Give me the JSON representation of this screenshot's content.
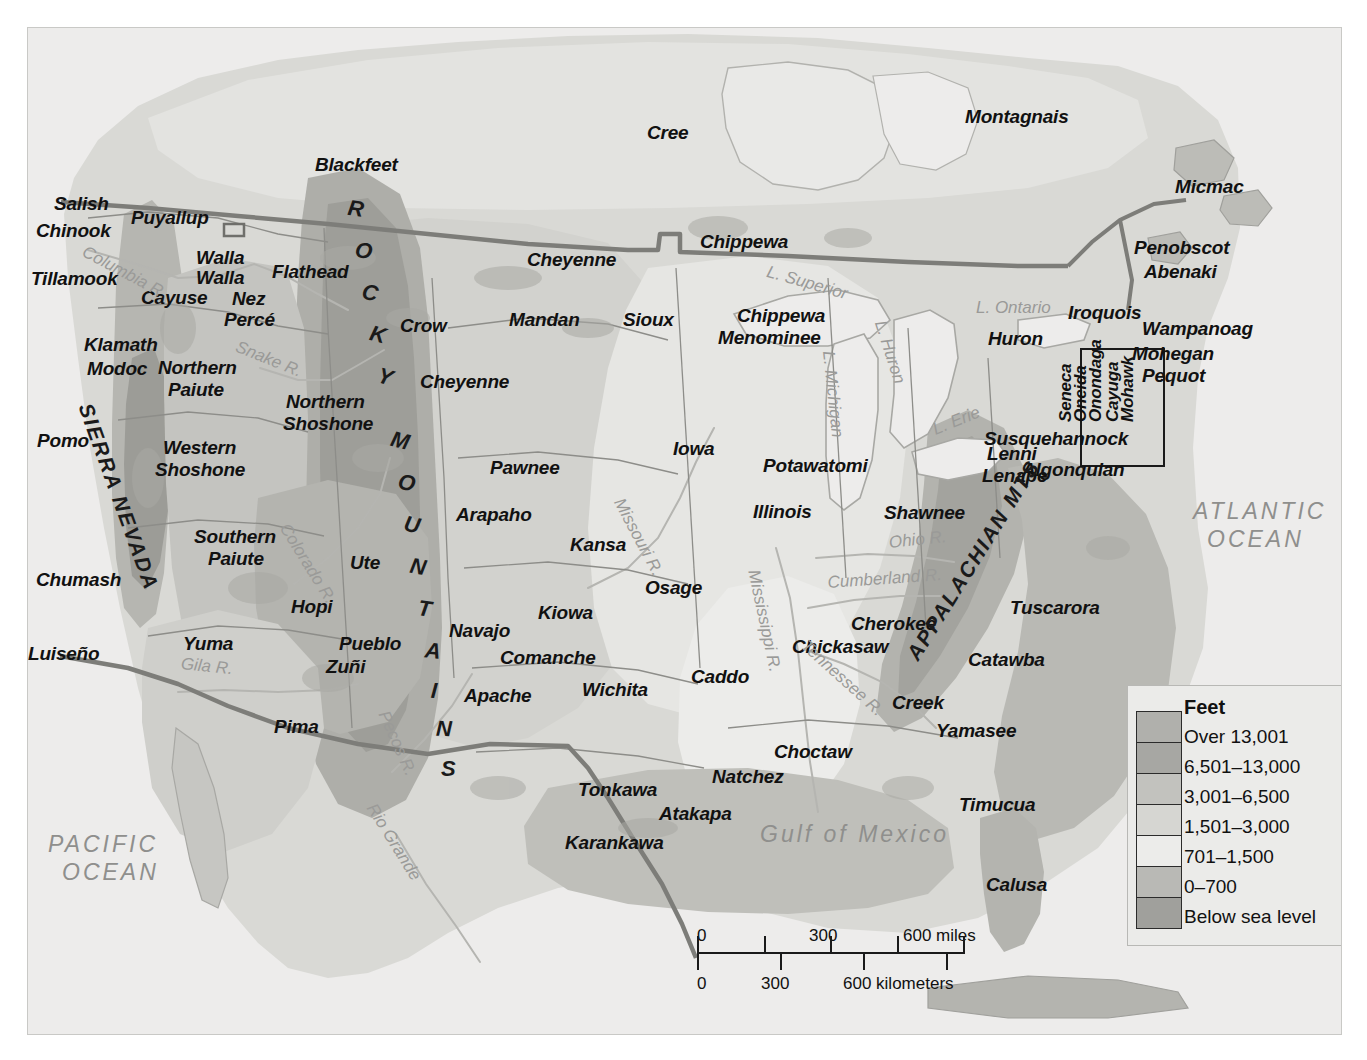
{
  "map": {
    "title": "Native American Culture Areas and Elevation of North America",
    "oceans": [
      {
        "name": "pacific-ocean",
        "lines": [
          "PACIFIC",
          "OCEAN"
        ],
        "x": 48,
        "y": 830
      },
      {
        "name": "atlantic-ocean",
        "lines": [
          "ATLANTIC",
          "OCEAN"
        ],
        "x": 1193,
        "y": 497
      },
      {
        "name": "gulf-of-mexico",
        "lines": [
          "Gulf of Mexico"
        ],
        "x": 760,
        "y": 820
      }
    ],
    "ranges": [
      {
        "name": "sierra-nevada",
        "label": "SIERRA NEVADA",
        "x": 96,
        "y": 400,
        "rotate": 70
      },
      {
        "name": "appalachian-mts",
        "label": "APPALACHIAN MTS",
        "x": 902,
        "y": 652,
        "rotate": -58
      },
      {
        "name": "rocky-mountains",
        "label": "ROCKY MOUNTAINS"
      }
    ],
    "rocky_letters": [
      {
        "ch": "R",
        "x": 348,
        "y": 196,
        "rot": 8
      },
      {
        "ch": "O",
        "x": 355,
        "y": 238,
        "rot": 10
      },
      {
        "ch": "C",
        "x": 362,
        "y": 280,
        "rot": 12
      },
      {
        "ch": "K",
        "x": 370,
        "y": 322,
        "rot": 14
      },
      {
        "ch": "Y",
        "x": 378,
        "y": 364,
        "rot": 16
      },
      {
        "ch": "M",
        "x": 391,
        "y": 428,
        "rot": 14
      },
      {
        "ch": "O",
        "x": 398,
        "y": 470,
        "rot": 13
      },
      {
        "ch": "U",
        "x": 404,
        "y": 512,
        "rot": 12
      },
      {
        "ch": "N",
        "x": 410,
        "y": 554,
        "rot": 10
      },
      {
        "ch": "T",
        "x": 418,
        "y": 596,
        "rot": 8
      },
      {
        "ch": "A",
        "x": 425,
        "y": 638,
        "rot": 6
      },
      {
        "ch": "I",
        "x": 431,
        "y": 678,
        "rot": 4
      },
      {
        "ch": "N",
        "x": 436,
        "y": 716,
        "rot": 2
      },
      {
        "ch": "S",
        "x": 441,
        "y": 756,
        "rot": 0
      }
    ],
    "hydro": [
      {
        "name": "columbia-river",
        "label": "Columbia R.",
        "x": 88,
        "y": 242,
        "rotate": 28
      },
      {
        "name": "snake-river",
        "label": "Snake R.",
        "x": 240,
        "y": 337,
        "rotate": 22
      },
      {
        "name": "colorado-river",
        "label": "Colorado R.",
        "x": 292,
        "y": 520,
        "rotate": 58
      },
      {
        "name": "gila-river",
        "label": "Gila R.",
        "x": 182,
        "y": 654,
        "rotate": 6
      },
      {
        "name": "pecos-river",
        "label": "Pecos R.",
        "x": 392,
        "y": 708,
        "rotate": 66
      },
      {
        "name": "rio-grande",
        "label": "Rio Grande",
        "x": 379,
        "y": 800,
        "rotate": 58
      },
      {
        "name": "missouri-river",
        "label": "Missouri R.",
        "x": 627,
        "y": 495,
        "rotate": 62
      },
      {
        "name": "mississippi-river",
        "label": "Mississippi R.",
        "x": 763,
        "y": 568,
        "rotate": 78
      },
      {
        "name": "ohio-river",
        "label": "Ohio R.",
        "x": 888,
        "y": 533,
        "rotate": -6
      },
      {
        "name": "cumberland-river",
        "label": "Cumberland R.",
        "x": 827,
        "y": 573,
        "rotate": -4
      },
      {
        "name": "tennessee-river",
        "label": "Tennessee R.",
        "x": 810,
        "y": 636,
        "rotate": 42
      },
      {
        "name": "lake-superior",
        "label": "L. Superior",
        "x": 770,
        "y": 262,
        "rotate": 16
      },
      {
        "name": "lake-michigan",
        "label": "L. Michigan",
        "x": 838,
        "y": 350,
        "rotate": 84
      },
      {
        "name": "lake-huron",
        "label": "L. Huron",
        "x": 889,
        "y": 318,
        "rotate": 72
      },
      {
        "name": "lake-erie",
        "label": "L. Erie",
        "x": 930,
        "y": 421,
        "rotate": -22
      },
      {
        "name": "lake-ontario",
        "label": "L. Ontario",
        "x": 976,
        "y": 298,
        "rotate": 0
      }
    ],
    "tribes": [
      {
        "label": "Salish",
        "x": 54,
        "y": 194
      },
      {
        "label": "Chinook",
        "x": 36,
        "y": 221
      },
      {
        "label": "Puyallup",
        "x": 131,
        "y": 208
      },
      {
        "label": "Tillamook",
        "x": 31,
        "y": 269
      },
      {
        "label": "Walla",
        "x": 196,
        "y": 248
      },
      {
        "label": "Walla",
        "x": 196,
        "y": 268
      },
      {
        "label": "Cayuse",
        "x": 141,
        "y": 288
      },
      {
        "label": "Nez",
        "x": 232,
        "y": 289
      },
      {
        "label": "Percé",
        "x": 224,
        "y": 310
      },
      {
        "label": "Flathead",
        "x": 272,
        "y": 262
      },
      {
        "label": "Blackfeet",
        "x": 315,
        "y": 155
      },
      {
        "label": "Cree",
        "x": 647,
        "y": 123
      },
      {
        "label": "Montagnais",
        "x": 965,
        "y": 107
      },
      {
        "label": "Micmac",
        "x": 1175,
        "y": 177
      },
      {
        "label": "Penobscot",
        "x": 1134,
        "y": 238
      },
      {
        "label": "Abenaki",
        "x": 1144,
        "y": 262
      },
      {
        "label": "Cheyenne",
        "x": 527,
        "y": 250
      },
      {
        "label": "Chippewa",
        "x": 700,
        "y": 232
      },
      {
        "label": "Chippewa",
        "x": 737,
        "y": 306
      },
      {
        "label": "Menominee",
        "x": 718,
        "y": 328
      },
      {
        "label": "Huron",
        "x": 988,
        "y": 329
      },
      {
        "label": "Iroquois",
        "x": 1068,
        "y": 303
      },
      {
        "label": "Wampanoag",
        "x": 1142,
        "y": 319
      },
      {
        "label": "Mohegan",
        "x": 1132,
        "y": 344
      },
      {
        "label": "Pequot",
        "x": 1142,
        "y": 366
      },
      {
        "label": "Klamath",
        "x": 84,
        "y": 335
      },
      {
        "label": "Modoc",
        "x": 87,
        "y": 359
      },
      {
        "label": "Northern",
        "x": 158,
        "y": 358
      },
      {
        "label": "Paiute",
        "x": 168,
        "y": 380
      },
      {
        "label": "Crow",
        "x": 400,
        "y": 316
      },
      {
        "label": "Mandan",
        "x": 509,
        "y": 310
      },
      {
        "label": "Sioux",
        "x": 623,
        "y": 310
      },
      {
        "label": "Cheyenne",
        "x": 420,
        "y": 372
      },
      {
        "label": "Northern",
        "x": 286,
        "y": 392
      },
      {
        "label": "Shoshone",
        "x": 283,
        "y": 414
      },
      {
        "label": "Pomo",
        "x": 37,
        "y": 431
      },
      {
        "label": "Western",
        "x": 163,
        "y": 438
      },
      {
        "label": "Shoshone",
        "x": 155,
        "y": 460
      },
      {
        "label": "Iowa",
        "x": 673,
        "y": 439
      },
      {
        "label": "Potawatomi",
        "x": 763,
        "y": 456
      },
      {
        "label": "Lenni",
        "x": 987,
        "y": 444
      },
      {
        "label": "Lenape",
        "x": 982,
        "y": 466
      },
      {
        "label": "Susquehannock",
        "x": 984,
        "y": 429
      },
      {
        "label": "Algonquian",
        "x": 1022,
        "y": 460
      },
      {
        "label": "Pawnee",
        "x": 490,
        "y": 458
      },
      {
        "label": "Illinois",
        "x": 753,
        "y": 502
      },
      {
        "label": "Shawnee",
        "x": 884,
        "y": 503
      },
      {
        "label": "Arapaho",
        "x": 456,
        "y": 505
      },
      {
        "label": "Southern",
        "x": 194,
        "y": 527
      },
      {
        "label": "Paiute",
        "x": 208,
        "y": 549
      },
      {
        "label": "Kansa",
        "x": 570,
        "y": 535
      },
      {
        "label": "Ute",
        "x": 350,
        "y": 553
      },
      {
        "label": "Chumash",
        "x": 36,
        "y": 570
      },
      {
        "label": "Osage",
        "x": 645,
        "y": 578
      },
      {
        "label": "Hopi",
        "x": 291,
        "y": 597
      },
      {
        "label": "Kiowa",
        "x": 538,
        "y": 603
      },
      {
        "label": "Tuscarora",
        "x": 1010,
        "y": 598
      },
      {
        "label": "Cherokee",
        "x": 851,
        "y": 614
      },
      {
        "label": "Luiseño",
        "x": 28,
        "y": 644
      },
      {
        "label": "Yuma",
        "x": 183,
        "y": 634
      },
      {
        "label": "Pueblo",
        "x": 339,
        "y": 634
      },
      {
        "label": "Navajo",
        "x": 449,
        "y": 621
      },
      {
        "label": "Zuñi",
        "x": 326,
        "y": 657
      },
      {
        "label": "Comanche",
        "x": 500,
        "y": 648
      },
      {
        "label": "Chickasaw",
        "x": 792,
        "y": 637
      },
      {
        "label": "Catawba",
        "x": 968,
        "y": 650
      },
      {
        "label": "Apache",
        "x": 464,
        "y": 686
      },
      {
        "label": "Wichita",
        "x": 582,
        "y": 680
      },
      {
        "label": "Caddo",
        "x": 691,
        "y": 667
      },
      {
        "label": "Creek",
        "x": 892,
        "y": 693
      },
      {
        "label": "Pima",
        "x": 274,
        "y": 717
      },
      {
        "label": "Yamasee",
        "x": 936,
        "y": 721
      },
      {
        "label": "Choctaw",
        "x": 774,
        "y": 742
      },
      {
        "label": "Natchez",
        "x": 712,
        "y": 767
      },
      {
        "label": "Tonkawa",
        "x": 578,
        "y": 780
      },
      {
        "label": "Timucua",
        "x": 959,
        "y": 795
      },
      {
        "label": "Atakapa",
        "x": 659,
        "y": 804
      },
      {
        "label": "Karankawa",
        "x": 565,
        "y": 833
      },
      {
        "label": "Calusa",
        "x": 986,
        "y": 875
      }
    ],
    "iroquois_nations": [
      {
        "label": "Seneca",
        "x": 1057,
        "y": 422
      },
      {
        "label": "Oneida",
        "x": 1072,
        "y": 422
      },
      {
        "label": "Onondaga",
        "x": 1087,
        "y": 422
      },
      {
        "label": "Cayuga",
        "x": 1104,
        "y": 422
      },
      {
        "label": "Mohawk",
        "x": 1119,
        "y": 422
      }
    ]
  },
  "legend": {
    "title": "Feet",
    "entries": [
      {
        "label": "Over 13,001",
        "color": "#b0b0ac"
      },
      {
        "label": "6,501–13,000",
        "color": "#a7a7a3"
      },
      {
        "label": "3,001–6,500",
        "color": "#c2c2be"
      },
      {
        "label": "1,501–3,000",
        "color": "#d6d6d2"
      },
      {
        "label": "701–1,500",
        "color": "#ececea"
      },
      {
        "label": "0–700",
        "color": "#b9b9b5"
      },
      {
        "label": "Below sea level",
        "color": "#a0a09c"
      }
    ]
  },
  "scalebar": {
    "miles_ticks": [
      "0",
      "300",
      "600 miles"
    ],
    "km_ticks": [
      "0",
      "300",
      "600 kilometers"
    ]
  }
}
